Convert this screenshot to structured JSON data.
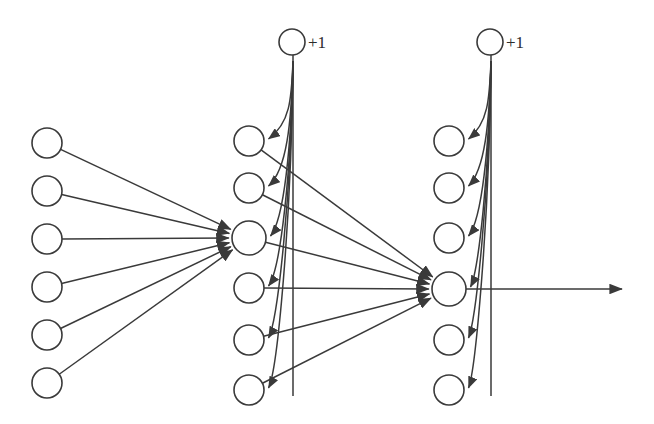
{
  "figure": {
    "name": "feedforward-neural-network",
    "background_color": "#ffffff",
    "stroke_color": "#3a3a3a",
    "width": 654,
    "height": 424
  },
  "bias_nodes": [
    {
      "id": "bias-hidden1",
      "label": "+1",
      "cx": 292,
      "cy": 42,
      "r": 13
    },
    {
      "id": "bias-hidden2",
      "label": "+1",
      "cx": 490,
      "cy": 42,
      "r": 13
    }
  ],
  "layers": [
    {
      "name": "input-layer",
      "index": 0,
      "cx": 47,
      "node_radius": 15,
      "node_count": 6,
      "nodes": [
        {
          "id": "input-1",
          "cy": 143
        },
        {
          "id": "input-2",
          "cy": 191
        },
        {
          "id": "input-3",
          "cy": 239
        },
        {
          "id": "input-4",
          "cy": 287
        },
        {
          "id": "input-5",
          "cy": 335
        },
        {
          "id": "input-6",
          "cy": 383
        }
      ]
    },
    {
      "name": "hidden-layer-1",
      "index": 1,
      "cx": 249,
      "node_radius": 15,
      "highlight_radius": 17,
      "node_count": 6,
      "nodes": [
        {
          "id": "hidden1-1",
          "cy": 141
        },
        {
          "id": "hidden1-2",
          "cy": 188
        },
        {
          "id": "hidden1-3",
          "cy": 238,
          "highlighted": true
        },
        {
          "id": "hidden1-4",
          "cy": 288
        },
        {
          "id": "hidden1-5",
          "cy": 340
        },
        {
          "id": "hidden1-6",
          "cy": 390
        }
      ]
    },
    {
      "name": "hidden-layer-2",
      "index": 2,
      "cx": 449,
      "node_radius": 15,
      "highlight_radius": 17,
      "node_count": 6,
      "nodes": [
        {
          "id": "hidden2-1",
          "cy": 141
        },
        {
          "id": "hidden2-2",
          "cy": 188
        },
        {
          "id": "hidden2-3",
          "cy": 238
        },
        {
          "id": "hidden2-4",
          "cy": 289,
          "highlighted": true
        },
        {
          "id": "hidden2-5",
          "cy": 340
        },
        {
          "id": "hidden2-6",
          "cy": 390
        }
      ]
    }
  ],
  "output_arrow": {
    "id": "output-arrow",
    "x1": 466,
    "y1": 289,
    "x2": 622,
    "y2": 289
  },
  "edge_groups": [
    {
      "name": "input-to-hidden1-node3",
      "target": "hidden1-3",
      "count": 6,
      "description": "All six input nodes connect into the third hidden-layer-1 unit"
    },
    {
      "name": "hidden1-to-hidden2-node4",
      "target": "hidden2-4",
      "count": 6,
      "description": "All six hidden-layer-1 nodes connect into the fourth hidden-layer-2 unit"
    },
    {
      "name": "bias1-to-hidden1",
      "source": "bias-hidden1",
      "count": 6,
      "description": "Bias +1 unit fans out to every hidden-layer-1 node"
    },
    {
      "name": "bias2-to-hidden2",
      "source": "bias-hidden2",
      "count": 6,
      "description": "Bias +1 unit fans out to every hidden-layer-2 node"
    }
  ]
}
